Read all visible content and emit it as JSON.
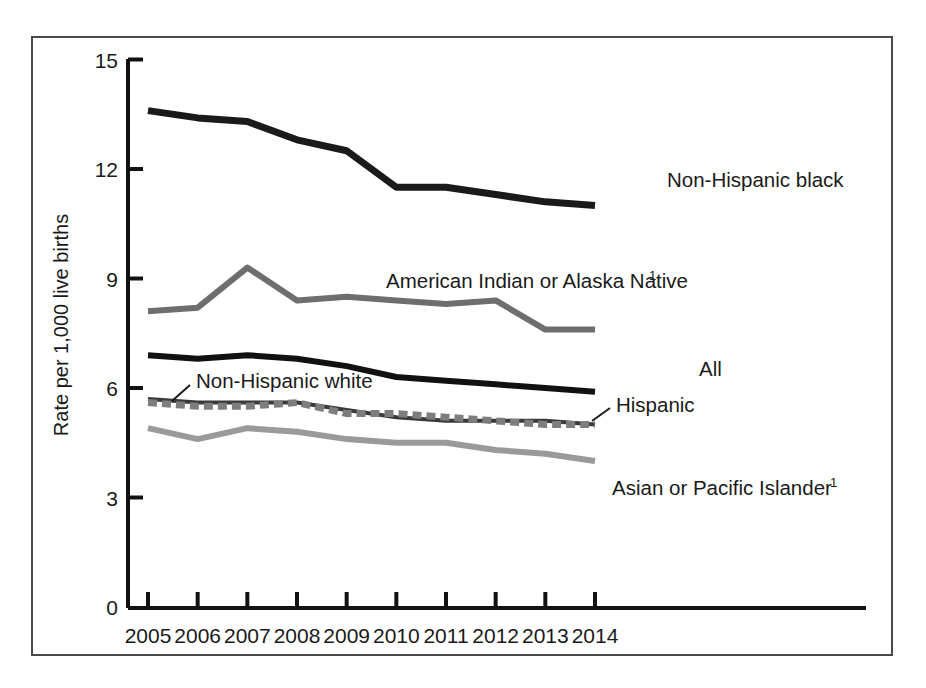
{
  "figure": {
    "y_axis_title": "Rate per 1,000 live births",
    "x_tick_labels": [
      "2005",
      "2006",
      "2007",
      "2008",
      "2009",
      "2010",
      "2011",
      "2012",
      "2013",
      "2014"
    ],
    "y_tick_labels": [
      "0",
      "3",
      "6",
      "9",
      "12",
      "15"
    ],
    "series_labels": {
      "non_hispanic_black": "Non-Hispanic black",
      "american_indian": "American Indian or Alaska Native",
      "american_indian_superscript": "1",
      "all": "All",
      "non_hispanic_white": "Non-Hispanic white",
      "hispanic": "Hispanic",
      "asian_pacific": "Asian or Pacific Islander",
      "asian_pacific_superscript": "1"
    },
    "colors": {
      "non_hispanic_black": "#1a1a1a",
      "american_indian": "#6e6e6e",
      "all": "#111111",
      "non_hispanic_white": "#3a3a3a",
      "hispanic": "#7d7d7d",
      "asian_pacific": "#9a9a9a",
      "axis": "#111111",
      "frame": "#4a4a4a",
      "background": "#ffffff"
    }
  },
  "chart_data": {
    "type": "line",
    "title": "",
    "xlabel": "",
    "ylabel": "Rate per 1,000 live births",
    "x": [
      2005,
      2006,
      2007,
      2008,
      2009,
      2010,
      2011,
      2012,
      2013,
      2014
    ],
    "categories": [
      "2005",
      "2006",
      "2007",
      "2008",
      "2009",
      "2010",
      "2011",
      "2012",
      "2013",
      "2014"
    ],
    "ylim": [
      0,
      15
    ],
    "yticks": [
      0,
      3,
      6,
      9,
      12,
      15
    ],
    "grid": false,
    "legend": "inline-annotations",
    "series": [
      {
        "name": "Non-Hispanic black",
        "color": "#1a1a1a",
        "style": "solid",
        "width": 7,
        "values": [
          13.6,
          13.4,
          13.3,
          12.8,
          12.5,
          11.5,
          11.5,
          11.3,
          11.1,
          11.0
        ]
      },
      {
        "name": "American Indian or Alaska Native",
        "color": "#6e6e6e",
        "style": "solid",
        "width": 6,
        "values": [
          8.1,
          8.2,
          9.3,
          8.4,
          8.5,
          8.4,
          8.3,
          8.4,
          7.6,
          7.6
        ]
      },
      {
        "name": "All",
        "color": "#111111",
        "style": "solid",
        "width": 6,
        "values": [
          6.9,
          6.8,
          6.9,
          6.8,
          6.6,
          6.3,
          6.2,
          6.1,
          6.0,
          5.9
        ]
      },
      {
        "name": "Non-Hispanic white",
        "color": "#3a3a3a",
        "style": "solid",
        "width": 4,
        "values": [
          5.7,
          5.6,
          5.6,
          5.6,
          5.4,
          5.2,
          5.1,
          5.1,
          5.1,
          5.0
        ]
      },
      {
        "name": "Hispanic",
        "color": "#7d7d7d",
        "style": "dashed",
        "width": 7,
        "values": [
          5.6,
          5.5,
          5.5,
          5.6,
          5.3,
          5.3,
          5.2,
          5.1,
          5.0,
          5.0
        ]
      },
      {
        "name": "Asian or Pacific Islander",
        "color": "#9a9a9a",
        "style": "solid",
        "width": 6,
        "values": [
          4.9,
          4.6,
          4.9,
          4.8,
          4.6,
          4.5,
          4.5,
          4.3,
          4.2,
          4.0
        ]
      }
    ]
  }
}
